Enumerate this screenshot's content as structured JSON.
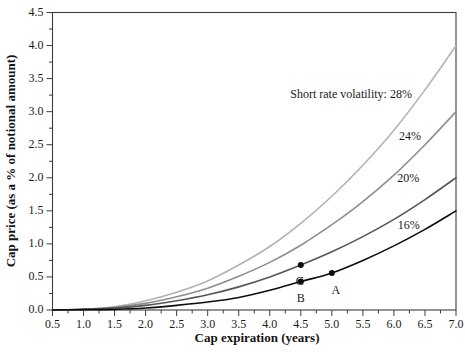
{
  "chart": {
    "background": "#ffffff",
    "axis_color": "#3c3c3c",
    "text_color": "#1a1a1a",
    "point_color": "#0d0d0d"
  },
  "chart_data": {
    "type": "line",
    "title": "",
    "xlabel": "Cap expiration (years)",
    "ylabel": "Cap price (as a % of notional amount)",
    "xlim": [
      0.5,
      7.0
    ],
    "ylim": [
      0.0,
      4.5
    ],
    "grid": false,
    "legend_position": "inline-curve-labels",
    "x_tick_labels": [
      "0.5",
      "1.0",
      "1.5",
      "2.0",
      "2.5",
      "3.0",
      "3.5",
      "4.0",
      "4.5",
      "5.0",
      "5.5",
      "6.0",
      "6.5",
      "7.0"
    ],
    "y_tick_labels": [
      "0.0",
      "0.5",
      "1.0",
      "1.5",
      "2.0",
      "2.5",
      "3.0",
      "3.5",
      "4.0",
      "4.5"
    ],
    "minor_tick_step": 0.25,
    "annotation": {
      "text": "Short rate volatility: 28%",
      "x": 5.31,
      "y": 3.25
    },
    "x": [
      0.5,
      1.0,
      1.5,
      2.0,
      2.5,
      3.0,
      3.5,
      4.0,
      4.5,
      5.0,
      5.5,
      6.0,
      6.5,
      7.0
    ],
    "series": [
      {
        "name": "28%",
        "color": "#b3b3b3",
        "values": [
          0,
          0.01,
          0.05,
          0.14,
          0.27,
          0.44,
          0.68,
          0.96,
          1.31,
          1.72,
          2.19,
          2.72,
          3.33,
          4.0
        ],
        "label": null
      },
      {
        "name": "24%",
        "color": "#8e8e8e",
        "values": [
          0,
          0.01,
          0.04,
          0.1,
          0.2,
          0.33,
          0.51,
          0.72,
          0.98,
          1.29,
          1.64,
          2.04,
          2.5,
          3.0
        ],
        "label": {
          "text": "24%",
          "x": 6.26,
          "y": 2.62
        }
      },
      {
        "name": "20%",
        "color": "#565656",
        "values": [
          0,
          0.01,
          0.03,
          0.07,
          0.14,
          0.23,
          0.35,
          0.5,
          0.68,
          0.88,
          1.11,
          1.37,
          1.67,
          2.0
        ],
        "label": {
          "text": "20%",
          "x": 6.23,
          "y": 1.98
        }
      },
      {
        "name": "16%",
        "color": "#0d0d0d",
        "values": [
          0,
          0.005,
          0.01,
          0.03,
          0.07,
          0.12,
          0.19,
          0.3,
          0.43,
          0.56,
          0.75,
          0.97,
          1.22,
          1.5
        ],
        "label": {
          "text": "16%",
          "x": 6.24,
          "y": 1.27
        }
      }
    ],
    "points": [
      {
        "label": "A",
        "x": 5.0,
        "y": 0.56,
        "series": "16%",
        "label_dx": 4,
        "label_dy": 12
      },
      {
        "label": "B",
        "x": 4.5,
        "y": 0.43,
        "series": "16%",
        "label_dx": 0,
        "label_dy": 12
      },
      {
        "label": "C",
        "x": 4.5,
        "y": 0.68,
        "series": "20%",
        "label_dx": -1,
        "label_dy": 11
      }
    ]
  }
}
